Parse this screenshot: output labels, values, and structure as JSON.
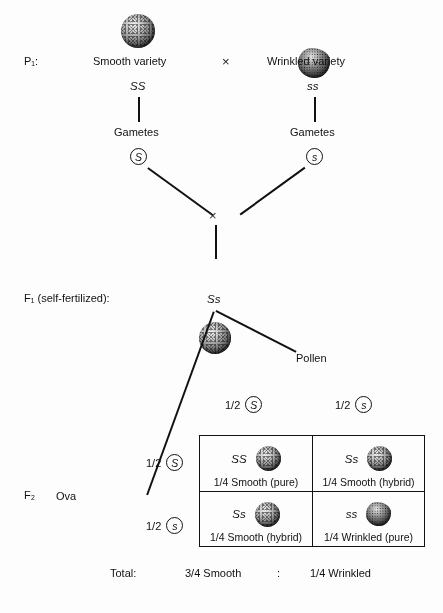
{
  "stages": {
    "p1": "P₁:",
    "f1": "F₁ (self-fertilized):",
    "f2": "F₂"
  },
  "parents": {
    "left": {
      "name": "Smooth variety",
      "genotype": "SS",
      "seed": "smooth-seed",
      "gametes_label": "Gametes",
      "gamete": "S"
    },
    "right": {
      "name": "Wrinkled variety",
      "genotype": "ss",
      "seed": "wrinkled-seed",
      "gametes_label": "Gametes",
      "gamete": "s"
    },
    "cross_symbol": "×"
  },
  "f1": {
    "genotype": "Ss",
    "seed": "smooth-seed",
    "cross_symbol": "×",
    "pollen_label": "Pollen",
    "ova_label": "Ova"
  },
  "punnett": {
    "col_headers": [
      {
        "fraction": "1/2",
        "allele": "S"
      },
      {
        "fraction": "1/2",
        "allele": "s"
      }
    ],
    "row_headers": [
      {
        "fraction": "1/2",
        "allele": "S"
      },
      {
        "fraction": "1/2",
        "allele": "s"
      }
    ],
    "cells": [
      {
        "genotype": "SS",
        "seed": "smooth-seed",
        "label": "1/4 Smooth (pure)"
      },
      {
        "genotype": "Ss",
        "seed": "smooth-seed",
        "label": "1/4 Smooth (hybrid)"
      },
      {
        "genotype": "Ss",
        "seed": "smooth-seed",
        "label": "1/4 Smooth (hybrid)"
      },
      {
        "genotype": "ss",
        "seed": "wrinkled-seed",
        "label": "1/4 Wrinkled (pure)"
      }
    ]
  },
  "total": {
    "label": "Total:",
    "smooth": "3/4 Smooth",
    "separator": ":",
    "wrinkled": "1/4 Wrinkled"
  }
}
